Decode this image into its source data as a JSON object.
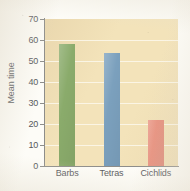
{
  "chart_data": {
    "type": "bar",
    "title": "",
    "xlabel": "",
    "ylabel": "Mean time",
    "categories": [
      "Barbs",
      "Tetras",
      "Cichlids"
    ],
    "values": [
      58,
      54,
      22
    ],
    "series": [
      {
        "name": "Mean time",
        "values": [
          58,
          54,
          22
        ],
        "colors": [
          "#8aab6b",
          "#7ba0bd",
          "#e8907e"
        ]
      }
    ],
    "ylim": [
      0,
      70
    ],
    "ytick_labels": [
      "70",
      "60",
      "50",
      "40",
      "30",
      "20",
      "10",
      "0"
    ],
    "ytick_values": [
      70,
      60,
      50,
      40,
      30,
      20,
      10,
      0
    ],
    "ytick_step": 10,
    "grid": true,
    "grid_axis": "y",
    "legend": false,
    "legend_position": "none",
    "plot_background": "#f3e3ba",
    "axis_color": "#8d8d8a",
    "text_color": "#55565a",
    "bar_colors": {
      "Barbs": "#8aab6b",
      "Tetras": "#7ba0bd",
      "Cichlids": "#e8907e"
    }
  }
}
